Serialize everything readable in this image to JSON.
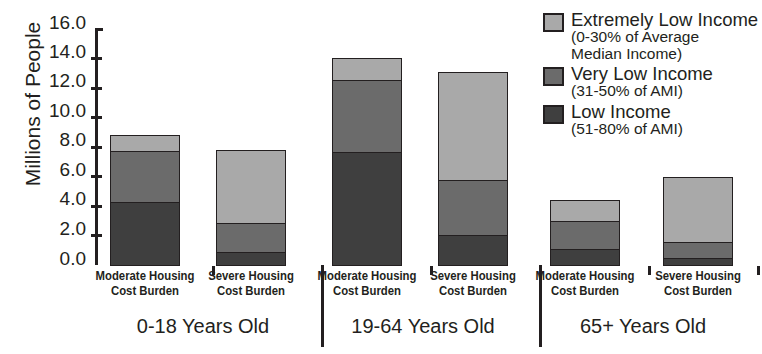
{
  "chart_data": {
    "type": "bar",
    "subtype": "stacked",
    "title": "",
    "xlabel": "",
    "ylabel": "Millions of People",
    "ylim": [
      0.0,
      16.0
    ],
    "ytick_step": 2.0,
    "ytick_labels": [
      "16.0",
      "14.0",
      "12.0",
      "10.0",
      "8.0",
      "6.0",
      "4.0",
      "2.0",
      "0.0"
    ],
    "grid": false,
    "legend_position": "top-right",
    "categories": [
      "Moderate Housing Cost Burden",
      "Severe Housing Cost Burden",
      "Moderate Housing Cost Burden",
      "Severe Housing Cost Burden",
      "Moderate Housing Cost Burden",
      "Severe Housing Cost Burden"
    ],
    "groups": [
      {
        "label": "0-18 Years Old",
        "categories": [
          "Moderate Housing Cost Burden",
          "Severe Housing Cost Burden"
        ]
      },
      {
        "label": "19-64 Years Old",
        "categories": [
          "Moderate Housing Cost Burden",
          "Severe Housing Cost Burden"
        ]
      },
      {
        "label": "65+ Years Old",
        "categories": [
          "Moderate Housing Cost Burden",
          "Severe Housing Cost Burden"
        ]
      }
    ],
    "series": [
      {
        "name": "Low Income",
        "sublabel": "(51-80% of AMI)",
        "color": "#3f3f3f",
        "values": [
          4.3,
          0.9,
          7.7,
          2.1,
          1.1,
          0.5
        ]
      },
      {
        "name": "Very Low Income",
        "sublabel": "(31-50% of AMI)",
        "color": "#6b6b6b",
        "values": [
          3.6,
          2.1,
          5.0,
          3.8,
          2.0,
          1.2
        ]
      },
      {
        "name": "Extremely Low Income",
        "sublabel": "(0-30% of Average Median Income)",
        "color": "#a9a9a9",
        "values": [
          1.2,
          5.1,
          1.6,
          7.5,
          1.55,
          4.5
        ]
      }
    ],
    "totals": [
      9.1,
      8.1,
      14.3,
      13.4,
      4.65,
      6.2
    ]
  },
  "axis": {
    "y_label": "Millions of People",
    "ticks": [
      {
        "label": "16.0",
        "value": 16.0
      },
      {
        "label": "14.0",
        "value": 14.0
      },
      {
        "label": "12.0",
        "value": 12.0
      },
      {
        "label": "10.0",
        "value": 10.0
      },
      {
        "label": "8.0",
        "value": 8.0
      },
      {
        "label": "6.0",
        "value": 6.0
      },
      {
        "label": "4.0",
        "value": 4.0
      },
      {
        "label": "2.0",
        "value": 2.0
      },
      {
        "label": "0.0",
        "value": 0.0
      }
    ]
  },
  "bars": [
    {
      "tick_line1": "Moderate Housing",
      "tick_line2": "Cost Burden",
      "low": 4.3,
      "verylow": 3.6,
      "extreme": 1.2
    },
    {
      "tick_line1": "Severe Housing",
      "tick_line2": "Cost Burden",
      "low": 0.9,
      "verylow": 2.1,
      "extreme": 5.1
    },
    {
      "tick_line1": "Moderate Housing",
      "tick_line2": "Cost Burden",
      "low": 7.7,
      "verylow": 5.0,
      "extreme": 1.6
    },
    {
      "tick_line1": "Severe Housing",
      "tick_line2": "Cost Burden",
      "low": 2.1,
      "verylow": 3.8,
      "extreme": 7.5
    },
    {
      "tick_line1": "Moderate Housing",
      "tick_line2": "Cost Burden",
      "low": 1.1,
      "verylow": 2.0,
      "extreme": 1.55
    },
    {
      "tick_line1": "Severe Housing",
      "tick_line2": "Cost Burden",
      "low": 0.5,
      "verylow": 1.2,
      "extreme": 4.5
    }
  ],
  "groups": [
    {
      "label": "0-18 Years Old"
    },
    {
      "label": "19-64 Years Old"
    },
    {
      "label": "65+ Years Old"
    }
  ],
  "legend": {
    "items": [
      {
        "label": "Extremely Low Income",
        "sublabel_line1": "(0-30% of Average",
        "sublabel_line2": "Median Income)",
        "color": "#a9a9a9"
      },
      {
        "label": "Very Low Income",
        "sublabel_line1": "(31-50% of AMI)",
        "sublabel_line2": "",
        "color": "#6b6b6b"
      },
      {
        "label": "Low Income",
        "sublabel_line1": "(51-80% of AMI)",
        "sublabel_line2": "",
        "color": "#3f3f3f"
      }
    ]
  }
}
